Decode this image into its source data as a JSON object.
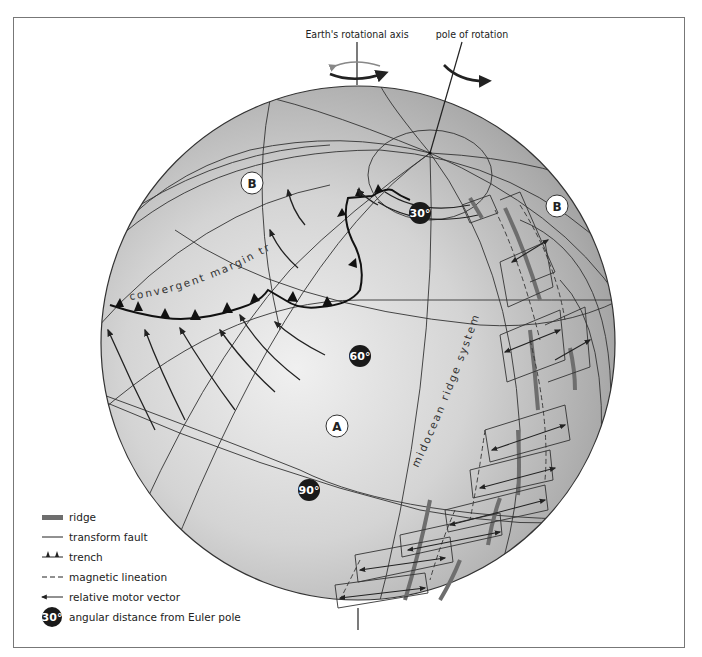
{
  "top_labels": {
    "earth_axis": "Earth's rotational axis",
    "pole_of_rotation": "pole of rotation"
  },
  "plates": {
    "a": "A",
    "b_left": "B",
    "b_right": "B"
  },
  "feature_labels": {
    "trench": "convergent margin trench",
    "ridge": "midocean ridge system"
  },
  "angular_badges": {
    "deg30": "30°",
    "deg60": "60°",
    "deg90": "90°"
  },
  "legend": {
    "items": [
      {
        "icon": "ridge-icon",
        "label": "ridge"
      },
      {
        "icon": "transform-fault-icon",
        "label": "transform fault"
      },
      {
        "icon": "trench-icon",
        "label": "trench"
      },
      {
        "icon": "magnetic-lineation-icon",
        "label": "magnetic lineation"
      },
      {
        "icon": "motion-vector-icon",
        "label": "relative motor vector"
      },
      {
        "icon": "angular-distance-icon",
        "label": "angular distance from Euler pole",
        "badge": "30°"
      }
    ]
  },
  "colors": {
    "globe_light": "#dedede",
    "globe_dark": "#8e8e8e",
    "ridge": "#6e6e6e",
    "line": "#2a2a2a",
    "badge": "#1a1a1a"
  }
}
